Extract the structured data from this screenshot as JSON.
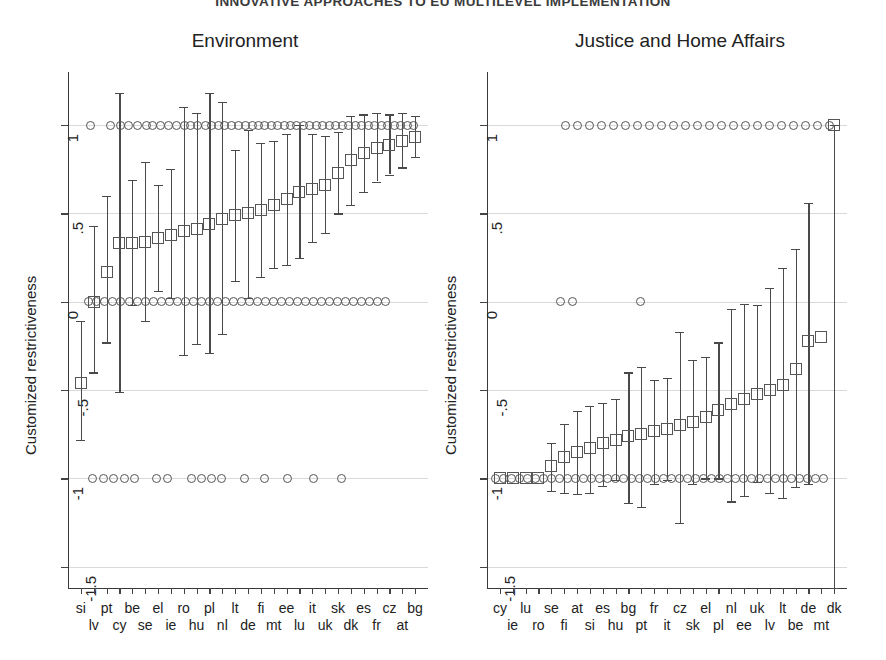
{
  "running_head": "INNOVATIVE APPROACHES TO EU MULTILEVEL IMPLEMENTATION",
  "axis": {
    "y_label": "Customized restrictiveness",
    "y_ticks": [
      "1",
      ".5",
      "0",
      "-.5",
      "-1",
      "-1.5"
    ],
    "y_tick_values": [
      1,
      0.5,
      0,
      -0.5,
      -1,
      -1.5
    ]
  },
  "chart_data": {
    "type": "scatter",
    "title": "INNOVATIVE APPROACHES TO EU MULTILEVEL IMPLEMENTATION",
    "ylabel": "Customized restrictiveness",
    "xlabel": "",
    "ylim": [
      -1.62,
      1.3
    ],
    "grid": true,
    "legend": null,
    "marker_note": "open squares = mean estimate with whiskers = confidence interval; open circles = individual observations at -1, 0, 1",
    "panels": [
      {
        "name": "environment",
        "title": "Environment",
        "categories": [
          "si",
          "lv",
          "pt",
          "cy",
          "be",
          "se",
          "el",
          "ie",
          "ro",
          "hu",
          "pl",
          "nl",
          "lt",
          "de",
          "fi",
          "mt",
          "ee",
          "lu",
          "it",
          "uk",
          "sk",
          "dk",
          "es",
          "fr",
          "cz",
          "at",
          "bg"
        ],
        "means": [
          -0.46,
          0.0,
          0.17,
          0.33,
          0.33,
          0.34,
          0.36,
          0.38,
          0.4,
          0.41,
          0.44,
          0.47,
          0.49,
          0.5,
          0.52,
          0.55,
          0.58,
          0.62,
          0.64,
          0.66,
          0.73,
          0.8,
          0.84,
          0.87,
          0.89,
          0.91,
          0.93
        ],
        "ci_low": [
          -0.78,
          -0.4,
          -0.23,
          -0.51,
          -0.02,
          -0.11,
          0.06,
          0.02,
          -0.3,
          -0.24,
          -0.29,
          -0.18,
          0.12,
          0.02,
          0.14,
          0.19,
          0.21,
          0.25,
          0.34,
          0.39,
          0.5,
          0.55,
          0.62,
          0.68,
          0.72,
          0.76,
          0.82
        ],
        "ci_high": [
          -0.11,
          0.43,
          0.6,
          1.18,
          0.69,
          0.79,
          0.66,
          0.75,
          1.1,
          1.07,
          1.18,
          1.13,
          0.86,
          0.97,
          0.9,
          0.91,
          0.95,
          1.0,
          0.95,
          0.94,
          0.96,
          1.05,
          1.06,
          1.07,
          1.06,
          1.07,
          1.05
        ],
        "observations_at": {
          "one": [
            90,
            110,
            120,
            128,
            137,
            146,
            152,
            160,
            168,
            176,
            184,
            190,
            197,
            205,
            211,
            218,
            224,
            231,
            238,
            245,
            252,
            258,
            264,
            271,
            277,
            284,
            290,
            296,
            303,
            309,
            316,
            322,
            329,
            335,
            342,
            348,
            355,
            361,
            368,
            374,
            381,
            387,
            394,
            400,
            407,
            413
          ],
          "zero": [
            88,
            96,
            104,
            112,
            120,
            129,
            137,
            145,
            153,
            161,
            169,
            177,
            185,
            193,
            201,
            209,
            217,
            225,
            233,
            241,
            249,
            257,
            265,
            273,
            281,
            289,
            297,
            305,
            313,
            321,
            329,
            337,
            345,
            353,
            361,
            369,
            377,
            385
          ],
          "minus_one": [
            92,
            103,
            113,
            124,
            134,
            156,
            167,
            191,
            201,
            211,
            221,
            244,
            264,
            287,
            313,
            341
          ]
        }
      },
      {
        "name": "justice_home_affairs",
        "title": "Justice and Home Affairs",
        "categories": [
          "cy",
          "ie",
          "lu",
          "ro",
          "se",
          "fi",
          "at",
          "si",
          "es",
          "hu",
          "bg",
          "pt",
          "fr",
          "it",
          "cz",
          "sk",
          "el",
          "pl",
          "nl",
          "ee",
          "uk",
          "lv",
          "lt",
          "be",
          "de",
          "mt",
          "dk"
        ],
        "means": [
          -1.0,
          -1.0,
          -1.0,
          -1.0,
          -0.93,
          -0.88,
          -0.85,
          -0.83,
          -0.8,
          -0.78,
          -0.76,
          -0.75,
          -0.73,
          -0.72,
          -0.7,
          -0.68,
          -0.65,
          -0.61,
          -0.58,
          -0.55,
          -0.52,
          -0.5,
          -0.47,
          -0.38,
          -0.22,
          -0.2,
          1.0
        ],
        "ci_low": [
          -1.0,
          -1.0,
          -1.0,
          -1.0,
          -1.07,
          -1.08,
          -1.09,
          -1.08,
          -1.04,
          -1.01,
          -1.14,
          -1.16,
          -1.03,
          -1.01,
          -1.25,
          -1.03,
          -1.0,
          -1.0,
          -1.13,
          -1.1,
          -1.02,
          -1.08,
          -1.11,
          -1.05,
          -1.03,
          1.0,
          -1.62
        ],
        "ci_high": [
          -1.0,
          -1.0,
          -1.0,
          -1.0,
          -0.8,
          -0.69,
          -0.62,
          -0.59,
          -0.57,
          -0.55,
          -0.4,
          -0.37,
          -0.44,
          -0.43,
          -0.17,
          -0.33,
          -0.31,
          -0.23,
          -0.04,
          -0.01,
          -0.02,
          0.08,
          0.19,
          0.3,
          0.56,
          1.0,
          1.0
        ],
        "observations_at": {
          "one": [
            565,
            577,
            589,
            601,
            613,
            625,
            637,
            649,
            661,
            673,
            685,
            697,
            709,
            721,
            733,
            745,
            757,
            769,
            781,
            793,
            805,
            817,
            829
          ],
          "zero": [
            560,
            572,
            640
          ],
          "minus_one": [
            495,
            503,
            511,
            519,
            527,
            535,
            543,
            551,
            559,
            567,
            575,
            583,
            591,
            599,
            607,
            615,
            623,
            631,
            639,
            647,
            655,
            663,
            671,
            679,
            687,
            695,
            703,
            711,
            719,
            727,
            735,
            743,
            751,
            759,
            767,
            775,
            783,
            791,
            799,
            807,
            815,
            823
          ]
        }
      }
    ]
  }
}
